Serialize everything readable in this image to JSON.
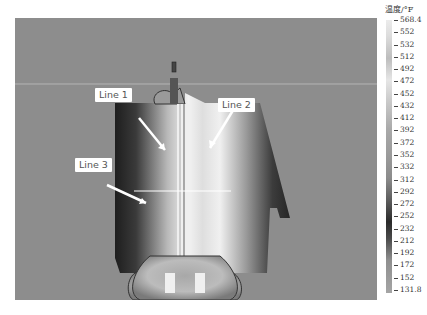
{
  "chart_data": {
    "type": "heatmap",
    "title": "",
    "colorbar": {
      "title": "温度/°F",
      "max_label": "568.4",
      "min_label": "131.8",
      "tick_labels": [
        "568.4",
        "552",
        "532",
        "512",
        "492",
        "472",
        "452",
        "432",
        "412",
        "392",
        "372",
        "352",
        "332",
        "312",
        "292",
        "272",
        "252",
        "232",
        "212",
        "192",
        "172",
        "152",
        "131.8"
      ],
      "range": [
        131.8,
        568.4
      ],
      "colormap": "grayscale (light high, dark near 232-252)"
    },
    "annotations": [
      {
        "label": "Line 1",
        "kind": "arrow callout"
      },
      {
        "label": "Line 2",
        "kind": "arrow callout"
      },
      {
        "label": "Line 3",
        "kind": "arrow callout + horizontal line across weld"
      }
    ],
    "grid": false,
    "legend_position": "right"
  },
  "labels": {
    "line1": "Line 1",
    "line2": "Line 2",
    "line3": "Line 3",
    "colorbar_title": "温度/°F"
  },
  "caption": ""
}
